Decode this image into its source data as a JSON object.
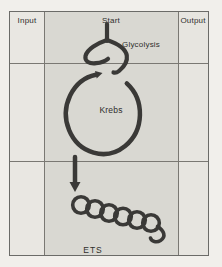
{
  "figure": {
    "columns": [
      {
        "label": "Input"
      },
      {
        "label": "Start"
      },
      {
        "label": "Output"
      }
    ],
    "stages": [
      {
        "label": "Glycolysis",
        "shape": "funnel-split"
      },
      {
        "label": "Krebs",
        "shape": "cycle-circle-arrow"
      },
      {
        "label": "ETS",
        "shape": "coil-chain"
      }
    ]
  },
  "colors": {
    "page_background": "#f1efeb",
    "side_cell_background": "#e8e6e1",
    "center_cell_background": "#d9d8d2",
    "grid_line": "#7a7873",
    "diagram_stroke": "#3a3937",
    "text": "#2f2e2c"
  }
}
